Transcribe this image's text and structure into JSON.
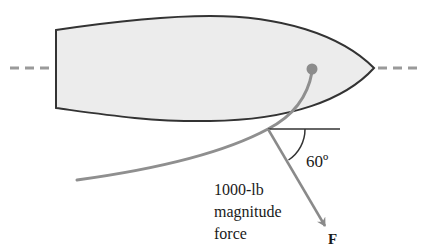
{
  "figure": {
    "angle_label": "60º",
    "force_label_lines": [
      "1000-lb",
      "magnitude",
      "force"
    ],
    "vector_label": "F"
  },
  "colors": {
    "hull_fill": "#ececec",
    "hull_outline": "#333333",
    "rope": "#8f8f8f",
    "dot": "#8c8c8c",
    "centerline": "#9a9a9a",
    "force_arrow": "#8a8a8a",
    "reference_line": "#333333"
  }
}
